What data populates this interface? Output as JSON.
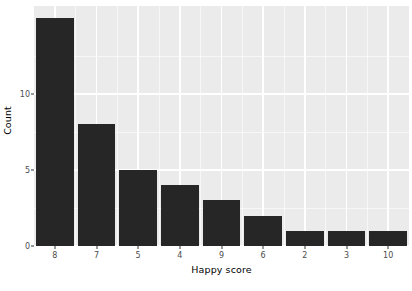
{
  "chart_data": {
    "type": "bar",
    "title": "",
    "subtitle": "",
    "xlabel": "Happy score",
    "ylabel": "Count",
    "categories": [
      "8",
      "7",
      "5",
      "4",
      "9",
      "6",
      "2",
      "3",
      "10"
    ],
    "values": [
      15,
      8,
      5,
      4,
      3,
      2,
      1,
      1,
      1
    ],
    "series": [
      {
        "name": "Count",
        "values": [
          15,
          8,
          5,
          4,
          3,
          2,
          1,
          1,
          1
        ]
      }
    ],
    "xlim": [
      0,
      9
    ],
    "ylim": [
      0,
      15.8
    ],
    "y_ticks": [
      0,
      5,
      10
    ],
    "y_tick_labels": [
      "0",
      "5",
      "10"
    ],
    "y_minor_ticks": [
      2.5,
      7.5,
      12.5
    ],
    "grid": true,
    "legend": false,
    "legend_position": "none",
    "bar_color": "#262626",
    "panel_color": "#ebebeb",
    "gridline_color": "#ffffff",
    "axis_text_color": "#4d4d4d",
    "background_color": "#ffffff",
    "annotations": []
  }
}
